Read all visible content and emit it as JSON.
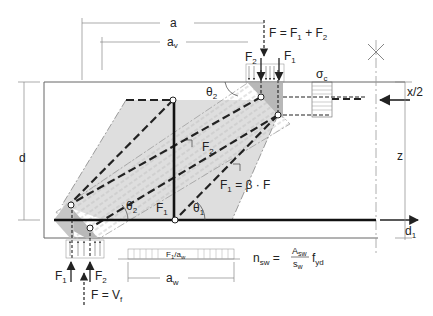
{
  "colors": {
    "line": "#222222",
    "thin": "#888888",
    "fill_light": "#dcdcdc",
    "fill_node": "#b8b8b8"
  },
  "labels": {
    "dim_a": "a",
    "dim_av": "a",
    "dim_av_sub": "v",
    "load_top": "F = F",
    "load_top_sub1": "1",
    "load_top_plus": " + F",
    "load_top_sub2": "2",
    "top_F2": "F",
    "top_F2_sub": "2",
    "top_F1": "F",
    "top_F1_sub": "1",
    "sigma_c": "σ",
    "sigma_c_sub": "c",
    "x_half": "x/2",
    "theta2_top": "θ",
    "theta2_top_sub": "2",
    "strut_F2": "F",
    "strut_F2_sub": "2",
    "d": "d",
    "z": "z",
    "F1_beta": "F",
    "F1_beta_sub": "1",
    "F1_beta_rest": " = β · F",
    "theta2_bot": "θ",
    "theta2_bot_sub": "2",
    "tie_F1": "F",
    "tie_F1_sub": "1",
    "theta1": "θ",
    "theta1_sub": "1",
    "d1": "d",
    "d1_sub": "1",
    "reaction_F1": "F",
    "reaction_F1_sub": "1",
    "reaction_F2": "F",
    "reaction_F2_sub": "2",
    "reaction_total": "F = V",
    "reaction_total_sub": "f",
    "stirrup_load": "F",
    "stirrup_load_sub": "1",
    "stirrup_load_rest": "/a",
    "stirrup_load_sub2": "w",
    "dim_aw": "a",
    "dim_aw_sub": "w",
    "nsw": "n",
    "nsw_sub": "sw",
    "nsw_eq": " =",
    "nsw_num": "A",
    "nsw_num_sub": "sw",
    "nsw_den": "s",
    "nsw_den_sub": "w",
    "nsw_f": "f",
    "nsw_f_sub": "yd"
  }
}
